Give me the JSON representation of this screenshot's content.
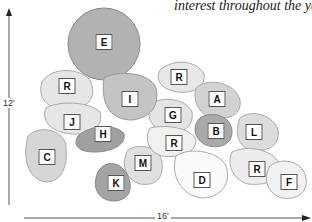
{
  "caption": "interest throughout the year.",
  "axes": {
    "height_label": "12'",
    "width_label": "16'"
  },
  "beds": [
    {
      "id": "E",
      "x": 104,
      "y": 42
    },
    {
      "id": "R",
      "x": 67,
      "y": 86
    },
    {
      "id": "R",
      "x": 179,
      "y": 77
    },
    {
      "id": "I",
      "x": 130,
      "y": 99
    },
    {
      "id": "A",
      "x": 217,
      "y": 99
    },
    {
      "id": "G",
      "x": 173,
      "y": 115
    },
    {
      "id": "J",
      "x": 72,
      "y": 122
    },
    {
      "id": "B",
      "x": 216,
      "y": 131
    },
    {
      "id": "L",
      "x": 254,
      "y": 132
    },
    {
      "id": "H",
      "x": 103,
      "y": 134
    },
    {
      "id": "C",
      "x": 47,
      "y": 157
    },
    {
      "id": "R",
      "x": 174,
      "y": 143
    },
    {
      "id": "M",
      "x": 143,
      "y": 163
    },
    {
      "id": "R",
      "x": 257,
      "y": 169
    },
    {
      "id": "D",
      "x": 202,
      "y": 180
    },
    {
      "id": "F",
      "x": 289,
      "y": 182
    },
    {
      "id": "K",
      "x": 116,
      "y": 183
    }
  ],
  "colors": {
    "dark": "#9a9a9a",
    "medium": "#bdbdbd",
    "light": "#dcdcdc",
    "outline": "#8a8a8a"
  }
}
